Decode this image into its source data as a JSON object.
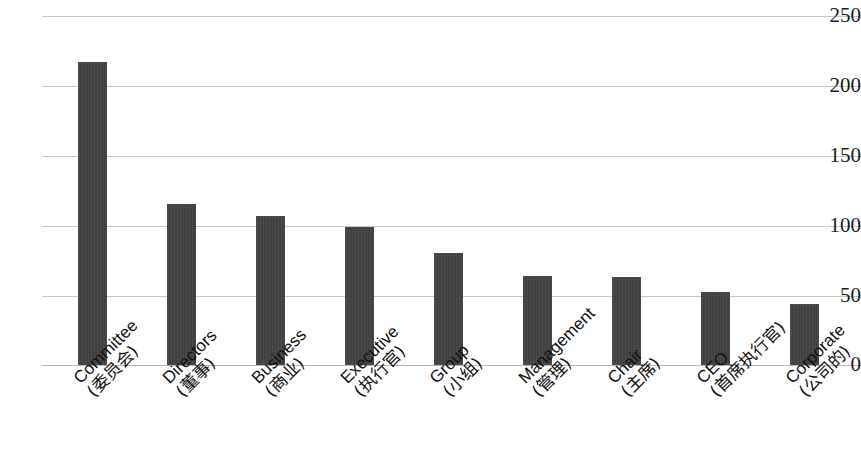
{
  "chart_data": {
    "type": "bar",
    "title": "",
    "xlabel": "",
    "ylabel": "",
    "ylim": [
      0,
      250
    ],
    "ytick_values": [
      250,
      200,
      150,
      100,
      50,
      0
    ],
    "ytick_labels": [
      "250",
      "200",
      "150",
      "100",
      "50",
      "0"
    ],
    "grid": true,
    "legend": "none",
    "bar_color": "#3d3d3d",
    "grid_color": "#c8c8c8",
    "categories": [
      "Committee (委员会)",
      "Directors (董事)",
      "Business (商业)",
      "Executive (执行官)",
      "Group (小组)",
      "Management (管理)",
      "Chair (主席)",
      "CEO (首席执行官)",
      "Corporate (公司的)"
    ],
    "category_parts": [
      {
        "en": "Committee",
        "zh": "(委员会)"
      },
      {
        "en": "Directors",
        "zh": "(董事)"
      },
      {
        "en": "Business",
        "zh": "(商业)"
      },
      {
        "en": "Executive",
        "zh": "(执行官)"
      },
      {
        "en": "Group",
        "zh": "(小组)"
      },
      {
        "en": "Management",
        "zh": "(管理)"
      },
      {
        "en": "Chair",
        "zh": "(主席)"
      },
      {
        "en": "CEO",
        "zh": "(首席执行官)"
      },
      {
        "en": "Corporate",
        "zh": "(公司的)"
      }
    ],
    "values": [
      217,
      115,
      107,
      99,
      80,
      64,
      63,
      52,
      44
    ]
  }
}
